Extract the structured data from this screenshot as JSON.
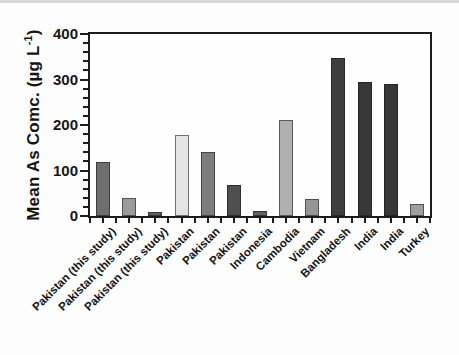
{
  "figure": {
    "background": "#fdfdfd",
    "scan_band_color": "#d8d8d8",
    "axis_color": "#1c1c1c",
    "text_color": "#141414"
  },
  "chart_data": {
    "type": "bar",
    "title": "",
    "ylabel": "Mean As Comc. (µg L⁻¹)",
    "ylabel_prefix": "Mean As Comc. (µg L",
    "ylabel_sup": "-1",
    "ylabel_suffix": ")",
    "xlabel": "",
    "ylim": [
      0,
      400
    ],
    "yticks": [
      0,
      100,
      200,
      300,
      400
    ],
    "minor_tick_interval": 20,
    "grid": false,
    "legend": "none",
    "categories": [
      "Pakistan (this study)",
      "Pakistan (this study)",
      "Pakistan (this study)",
      "Pakistan",
      "Pakistan",
      "Pakistan",
      "Indonesia",
      "Cambodia",
      "Vietnam",
      "Bangladesh",
      "India",
      "India",
      "Turkey"
    ],
    "values": [
      118,
      40,
      8,
      178,
      140,
      68,
      10,
      210,
      38,
      347,
      295,
      290,
      27
    ],
    "bar_colors": [
      "#6e6e6e",
      "#9b9b9b",
      "#5f5f5f",
      "#e4e4e4",
      "#7d7d7d",
      "#4e4e4e",
      "#636363",
      "#aeaeae",
      "#979797",
      "#3e3e3e",
      "#383838",
      "#383838",
      "#9e9e9e"
    ]
  }
}
